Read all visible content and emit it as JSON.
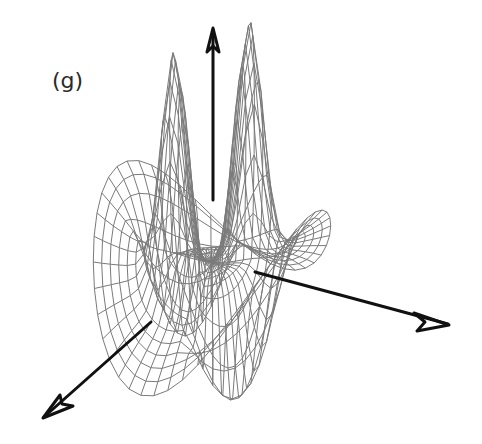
{
  "figure": {
    "panel_label": "(g)",
    "colors": {
      "background": "#ffffff",
      "mesh": "#7a7a7a",
      "axes": "#111111",
      "label": "#2a2a2a"
    },
    "axes": [
      {
        "name": "vertical-axis",
        "from": [
          213,
          200
        ],
        "to": [
          213,
          27
        ]
      },
      {
        "name": "right-axis",
        "from": [
          255,
          272
        ],
        "to": [
          450,
          325
        ]
      },
      {
        "name": "left-axis",
        "from": [
          150,
          323
        ],
        "to": [
          42,
          419
        ]
      }
    ],
    "landmarks": {
      "left_peak_top": [
        202,
        66
      ],
      "right_peak_top": [
        235,
        97
      ],
      "left_wing_top": [
        106,
        240
      ],
      "right_wing_top": [
        304,
        177
      ],
      "dip_left": [
        161,
        405
      ],
      "dip_middle": [
        199,
        388
      ],
      "dip_right": [
        269,
        380
      ]
    }
  }
}
